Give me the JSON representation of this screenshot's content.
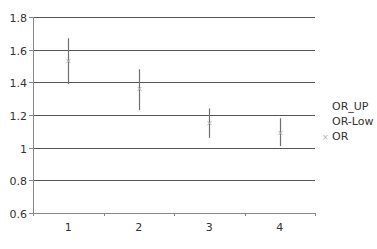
{
  "chart_data": {
    "type": "scatter",
    "title": "",
    "xlabel": "",
    "ylabel": "",
    "categories": [
      "1",
      "2",
      "3",
      "4"
    ],
    "ylim": [
      0.6,
      1.8
    ],
    "yticks": [
      "0.6",
      "0.8",
      "1",
      "1.2",
      "1.4",
      "1.6",
      "1.8"
    ],
    "grid": true,
    "legend_position": "right",
    "series": [
      {
        "name": "OR_UP",
        "values": [
          1.67,
          1.48,
          1.24,
          1.18
        ]
      },
      {
        "name": "OR-Low",
        "values": [
          1.39,
          1.23,
          1.06,
          1.01
        ]
      },
      {
        "name": "OR",
        "values": [
          1.53,
          1.36,
          1.15,
          1.09
        ],
        "marker": "x"
      }
    ],
    "colors": {
      "grid": "#555555",
      "axis": "#888888",
      "errorbar": "#6e6e6e",
      "marker": "#b0b0b0",
      "text": "#333333"
    }
  },
  "legend": {
    "items": [
      {
        "label": "OR_UP"
      },
      {
        "label": "OR-Low"
      },
      {
        "label": "OR",
        "marker": "×"
      }
    ]
  }
}
